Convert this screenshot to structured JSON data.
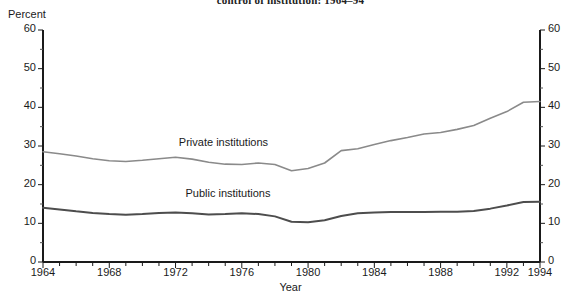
{
  "chart_data": {
    "type": "line",
    "title": "control of institution: 1964–94",
    "xlabel": "Year",
    "ylabel": "Percent",
    "ylim": [
      0,
      60
    ],
    "xlim": [
      1964,
      1994
    ],
    "grid": false,
    "legend_position": "inline-annotation",
    "y_ticks": [
      0,
      10,
      20,
      30,
      40,
      50,
      60
    ],
    "y_ticks_right": [
      0,
      10,
      20,
      30,
      40,
      50,
      60
    ],
    "x_ticks": [
      1964,
      1968,
      1972,
      1976,
      1980,
      1984,
      1988,
      1992,
      1994
    ],
    "x": [
      1964,
      1965,
      1966,
      1967,
      1968,
      1969,
      1970,
      1971,
      1972,
      1973,
      1974,
      1975,
      1976,
      1977,
      1978,
      1979,
      1980,
      1981,
      1982,
      1983,
      1984,
      1985,
      1986,
      1987,
      1988,
      1989,
      1990,
      1991,
      1992,
      1993,
      1994
    ],
    "series": [
      {
        "name": "Private institutions",
        "color": "#8a8a8a",
        "label_x": 1972.2,
        "label_y": 30.6,
        "values": [
          28.5,
          28.0,
          27.4,
          26.7,
          26.2,
          26.0,
          26.3,
          26.7,
          27.1,
          26.6,
          25.8,
          25.3,
          25.2,
          25.6,
          25.2,
          23.6,
          24.2,
          25.6,
          28.8,
          29.3,
          30.4,
          31.4,
          32.2,
          33.1,
          33.5,
          34.3,
          35.3,
          37.2,
          38.9,
          41.3,
          41.5
        ]
      },
      {
        "name": "Public institutions",
        "color": "#4d4d4d",
        "label_x": 1972.6,
        "label_y": 17.4,
        "values": [
          14.0,
          13.6,
          13.1,
          12.7,
          12.4,
          12.2,
          12.4,
          12.7,
          12.8,
          12.6,
          12.3,
          12.4,
          12.6,
          12.4,
          11.8,
          10.4,
          10.3,
          10.8,
          11.9,
          12.6,
          12.8,
          12.9,
          12.9,
          12.9,
          13.0,
          13.0,
          13.2,
          13.8,
          14.6,
          15.5,
          15.6
        ]
      }
    ]
  }
}
